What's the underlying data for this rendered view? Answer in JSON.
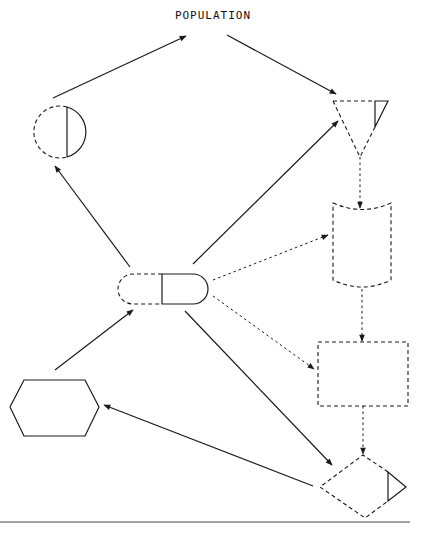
{
  "diagram": {
    "title": "POPULATION",
    "line_color": "#1a1a1a",
    "background": "#ffffff",
    "nodes": [
      {
        "id": "population",
        "shape": "text-label",
        "label": "POPULATION"
      },
      {
        "id": "circle",
        "shape": "circle",
        "style": "left half dashed, right half solid with solid vertical chord"
      },
      {
        "id": "inverted-triangle",
        "shape": "inverted-triangle (merge)",
        "style": "dashed with small solid triangle at top-right corner"
      },
      {
        "id": "punched-card",
        "shape": "stored-data / curved-top-bottom",
        "style": "dashed"
      },
      {
        "id": "rectangle",
        "shape": "process rectangle",
        "style": "dashed"
      },
      {
        "id": "diamond",
        "shape": "decision diamond",
        "style": "dashed with small solid triangle at right corner"
      },
      {
        "id": "terminal",
        "shape": "terminator capsule",
        "style": "left half dashed, right half solid"
      },
      {
        "id": "hexagon",
        "shape": "hexagon (preparation)",
        "style": "solid"
      }
    ],
    "edges": [
      {
        "from": "circle",
        "to": "population",
        "style": "solid"
      },
      {
        "from": "population",
        "to": "inverted-triangle",
        "style": "solid"
      },
      {
        "from": "terminal",
        "to": "circle",
        "style": "solid"
      },
      {
        "from": "terminal",
        "to": "inverted-triangle",
        "style": "solid"
      },
      {
        "from": "terminal",
        "to": "punched-card",
        "style": "dashed"
      },
      {
        "from": "terminal",
        "to": "rectangle",
        "style": "dashed"
      },
      {
        "from": "terminal",
        "to": "diamond",
        "style": "solid"
      },
      {
        "from": "hexagon",
        "to": "terminal",
        "style": "solid"
      },
      {
        "from": "diamond",
        "to": "hexagon",
        "style": "solid"
      },
      {
        "from": "inverted-triangle",
        "to": "punched-card",
        "style": "dashed"
      },
      {
        "from": "punched-card",
        "to": "rectangle",
        "style": "dashed"
      },
      {
        "from": "rectangle",
        "to": "diamond",
        "style": "dashed"
      }
    ]
  }
}
